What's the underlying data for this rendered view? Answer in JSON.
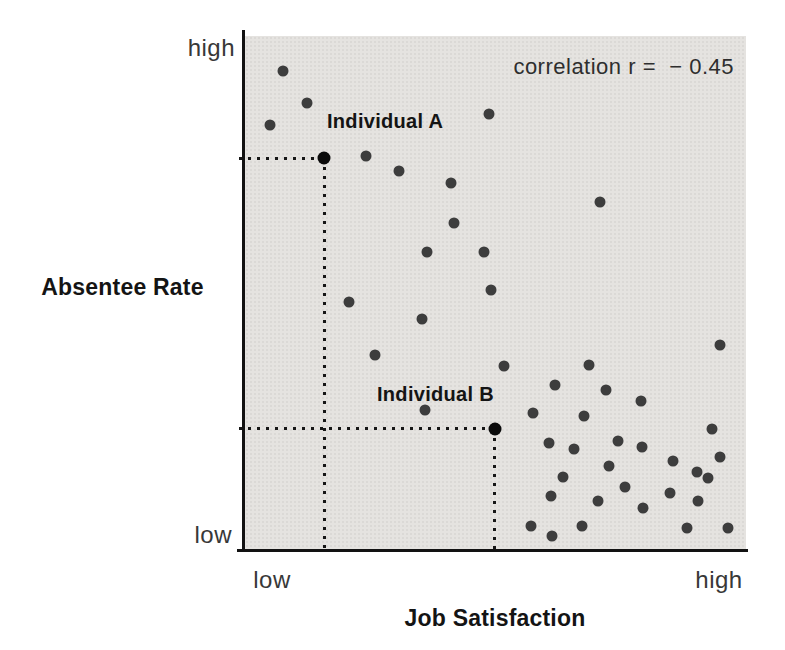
{
  "figure": {
    "correlation_label": "correlation r =  − 0.45",
    "y_axis": {
      "title": "Absentee Rate",
      "top_tick": "high",
      "bottom_tick": "low"
    },
    "x_axis": {
      "title": "Job Satisfaction",
      "left_tick": "low",
      "right_tick": "high"
    }
  },
  "chart_data": {
    "type": "scatter",
    "title": "",
    "xlabel": "Job Satisfaction",
    "ylabel": "Absentee Rate",
    "x_tick_labels": [
      "low",
      "high"
    ],
    "y_tick_labels": [
      "low",
      "high"
    ],
    "annotation": "correlation r = −0.45",
    "axis_units": "relative 0–100 scale (low = 0, high = 100), estimated from pixel positions",
    "legend": "none",
    "grid": false,
    "points": [
      {
        "x": 7.6,
        "y": 93.2
      },
      {
        "x": 12.4,
        "y": 87.0
      },
      {
        "x": 5.0,
        "y": 82.6
      },
      {
        "x": 48.7,
        "y": 84.7
      },
      {
        "x": 24.2,
        "y": 76.6
      },
      {
        "x": 30.7,
        "y": 73.6
      },
      {
        "x": 41.1,
        "y": 71.3
      },
      {
        "x": 70.9,
        "y": 67.6
      },
      {
        "x": 41.7,
        "y": 63.6
      },
      {
        "x": 36.3,
        "y": 57.9
      },
      {
        "x": 47.7,
        "y": 57.8
      },
      {
        "x": 49.1,
        "y": 50.4
      },
      {
        "x": 20.8,
        "y": 48.1
      },
      {
        "x": 35.3,
        "y": 44.8
      },
      {
        "x": 94.8,
        "y": 39.7
      },
      {
        "x": 25.9,
        "y": 37.8
      },
      {
        "x": 51.7,
        "y": 35.7
      },
      {
        "x": 68.7,
        "y": 35.9
      },
      {
        "x": 61.9,
        "y": 32.0
      },
      {
        "x": 72.1,
        "y": 31.0
      },
      {
        "x": 79.0,
        "y": 28.9
      },
      {
        "x": 35.9,
        "y": 27.1
      },
      {
        "x": 57.5,
        "y": 26.6
      },
      {
        "x": 67.7,
        "y": 26.0
      },
      {
        "x": 93.2,
        "y": 23.4
      },
      {
        "x": 74.5,
        "y": 21.1
      },
      {
        "x": 60.7,
        "y": 20.7
      },
      {
        "x": 79.2,
        "y": 19.8
      },
      {
        "x": 65.7,
        "y": 19.4
      },
      {
        "x": 94.8,
        "y": 18.0
      },
      {
        "x": 85.4,
        "y": 17.1
      },
      {
        "x": 72.7,
        "y": 16.1
      },
      {
        "x": 90.2,
        "y": 15.1
      },
      {
        "x": 63.5,
        "y": 14.1
      },
      {
        "x": 92.4,
        "y": 13.8
      },
      {
        "x": 75.8,
        "y": 12.0
      },
      {
        "x": 84.8,
        "y": 10.9
      },
      {
        "x": 61.1,
        "y": 10.3
      },
      {
        "x": 70.5,
        "y": 9.3
      },
      {
        "x": 90.4,
        "y": 9.3
      },
      {
        "x": 79.4,
        "y": 7.9
      },
      {
        "x": 57.1,
        "y": 4.5
      },
      {
        "x": 67.3,
        "y": 4.5
      },
      {
        "x": 88.2,
        "y": 4.1
      },
      {
        "x": 96.4,
        "y": 4.1
      },
      {
        "x": 61.3,
        "y": 2.5
      }
    ],
    "highlighted_points": [
      {
        "name": "Individual A",
        "x": 15.8,
        "y": 76.2,
        "guides": "dotted lines to both axes"
      },
      {
        "name": "Individual B",
        "x": 49.9,
        "y": 23.4,
        "guides": "dotted lines to both axes"
      }
    ],
    "colors": {
      "point": "#3d3d3d",
      "highlight_point": "#0b0b0b",
      "plot_bg": "#e5e3e0",
      "axis": "#121212",
      "guide_dots": "#161616"
    }
  }
}
